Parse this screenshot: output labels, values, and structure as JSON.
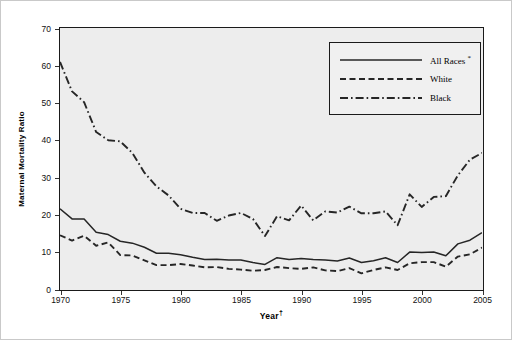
{
  "chart_data": {
    "type": "line",
    "title": "",
    "xlabel": "Year",
    "xlabel_marker": "†",
    "ylabel": "Maternal Mortality Ratio",
    "xlim": [
      1970,
      2005
    ],
    "ylim": [
      0,
      70
    ],
    "ytick_labels": [
      "0",
      "10",
      "20",
      "30",
      "40",
      "50",
      "60",
      "70"
    ],
    "ytick_values": [
      0,
      10,
      20,
      30,
      40,
      50,
      60,
      70
    ],
    "xtick_labels": [
      "1970",
      "1975",
      "1980",
      "1985",
      "1990",
      "1995",
      "2000",
      "2005"
    ],
    "xtick_values": [
      1970,
      1975,
      1980,
      1985,
      1990,
      1995,
      2000,
      2005
    ],
    "grid": false,
    "legend_position": "top-right",
    "x": [
      1970,
      1971,
      1972,
      1973,
      1974,
      1975,
      1976,
      1977,
      1978,
      1979,
      1980,
      1981,
      1982,
      1983,
      1984,
      1985,
      1986,
      1987,
      1988,
      1989,
      1990,
      1991,
      1992,
      1993,
      1994,
      1995,
      1996,
      1997,
      1998,
      1999,
      2000,
      2001,
      2002,
      2003,
      2004,
      2005
    ],
    "series": [
      {
        "name": "All Races *",
        "style": "solid",
        "color": "#262626",
        "values": [
          21.5,
          18.8,
          18.8,
          15.2,
          14.6,
          12.8,
          12.3,
          11.2,
          9.6,
          9.6,
          9.2,
          8.5,
          7.9,
          8.0,
          7.8,
          7.8,
          7.1,
          6.6,
          8.4,
          7.9,
          8.2,
          7.9,
          7.8,
          7.5,
          8.3,
          7.1,
          7.6,
          8.4,
          7.1,
          9.9,
          9.8,
          9.9,
          8.9,
          12.1,
          13.1,
          15.1
        ]
      },
      {
        "name": "White",
        "style": "dashed",
        "color": "#262626",
        "values": [
          14.4,
          13.0,
          14.3,
          11.6,
          12.5,
          9.1,
          9.0,
          7.7,
          6.4,
          6.4,
          6.7,
          6.3,
          5.8,
          5.9,
          5.4,
          5.2,
          4.9,
          5.1,
          5.9,
          5.6,
          5.4,
          5.8,
          5.0,
          4.8,
          5.6,
          4.2,
          5.1,
          5.8,
          5.1,
          6.9,
          7.2,
          7.2,
          6.0,
          8.7,
          9.3,
          11.1
        ]
      },
      {
        "name": "Black",
        "style": "dashdot",
        "color": "#262626",
        "values": [
          60.9,
          53.0,
          50.1,
          42.1,
          39.9,
          39.6,
          36.5,
          31.2,
          27.5,
          25.1,
          21.5,
          20.4,
          20.4,
          18.3,
          19.7,
          20.4,
          18.8,
          14.2,
          19.5,
          18.4,
          22.4,
          18.4,
          20.8,
          20.5,
          22.1,
          20.3,
          20.3,
          20.8,
          17.1,
          25.4,
          22.0,
          24.7,
          24.9,
          30.5,
          34.7,
          36.5
        ]
      }
    ]
  }
}
